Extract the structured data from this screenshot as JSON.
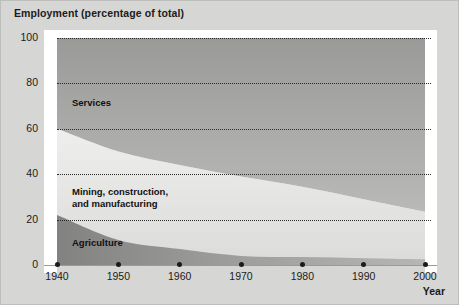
{
  "figure": {
    "title": "Employment (percentage of total)",
    "xaxis_name": "Year"
  },
  "chart_data": {
    "type": "area",
    "title": "Employment (percentage of total)",
    "subtitle": "",
    "xlabel": "Year",
    "ylabel": "Employment (percentage of total)",
    "stacked": true,
    "grid": true,
    "legend": "in-plot labels",
    "xlim": [
      1940,
      2000
    ],
    "ylim": [
      0,
      100
    ],
    "xticks": [
      1940,
      1950,
      1960,
      1970,
      1980,
      1990,
      2000
    ],
    "xticklabels": [
      "1940",
      "1950",
      "1960",
      "1970",
      "1980",
      "1990",
      "2000"
    ],
    "yticks": [
      0,
      20,
      40,
      60,
      80,
      100
    ],
    "yticklabels": [
      "0",
      "20",
      "40",
      "60",
      "80",
      "100"
    ],
    "x": [
      1940,
      1950,
      1960,
      1970,
      1980,
      1990,
      2000
    ],
    "series": [
      {
        "name": "Agriculture",
        "color": "#8e8e8c",
        "values": [
          22,
          11,
          7,
          4,
          3.5,
          3,
          2.5
        ]
      },
      {
        "name": "Mining, construction,\nand manufacturing",
        "color": "#e3e3e1",
        "values": [
          38,
          39,
          37,
          35,
          31,
          26,
          21
        ]
      },
      {
        "name": "Services",
        "color": "#9e9e9c",
        "values": [
          40,
          50,
          56,
          61,
          65.5,
          71,
          76.5
        ]
      }
    ],
    "annotations": [
      {
        "text": "Services",
        "x": 1942,
        "y": 70
      },
      {
        "text": "Mining, construction, and manufacturing",
        "x": 1942,
        "y": 30
      },
      {
        "text": "Agriculture",
        "x": 1942,
        "y": 11
      }
    ]
  },
  "colors": {
    "background": "#d6d6d4",
    "plot_white": "#ffffff",
    "services_fill_top": "#9b9b99",
    "services_fill_bottom": "#b4b4b2",
    "manufacturing_fill": "#e8e8e6",
    "agriculture_fill": "#8d8d8b",
    "gridline": "#2b2b2b",
    "text": "#1b1b1b"
  }
}
